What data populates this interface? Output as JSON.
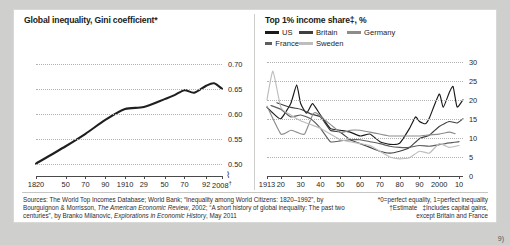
{
  "figure": {
    "page_marker": "9)",
    "background_color": "#cfcfcd",
    "paper_color": "#ffffff"
  },
  "left_panel": {
    "title": "Global inequality, Gini coefficient*"
  },
  "right_panel": {
    "title": "Top 1% income share‡, %",
    "legend": [
      {
        "label": "US",
        "color": "#1a1a1a"
      },
      {
        "label": "Britain",
        "color": "#3f3f3f"
      },
      {
        "label": "Germany",
        "color": "#8c8c8c"
      },
      {
        "label": "France",
        "color": "#5e5e5e"
      },
      {
        "label": "Sweden",
        "color": "#bdbdbd"
      }
    ]
  },
  "footnotes": {
    "sources": "Sources: The World Top Incomes Database; World Bank; “Inequality among World Citizens: 1820–1992”, by Bourguignon & Morrisson, The American Economic Review, 2002; “A short history of global inequality: The past two centuries”, by Branko Milanovic, Explorations in Economic History, May 2011",
    "sources_italic_1": "The American Economic Review",
    "sources_italic_2": "Explorations in Economic History",
    "note_star": "*0=perfect equality, 1=perfect inequality",
    "note_dagger": "†Estimate",
    "note_doubledagger": "‡Includes capital gains,",
    "note_doubledagger_2": "except Britain and France"
  },
  "chart_data": [
    {
      "type": "line",
      "id": "global-gini",
      "title": "Global inequality, Gini coefficient*",
      "xlabel": "",
      "ylabel": "",
      "ylim": [
        0.475,
        0.725
      ],
      "yticks": [
        0.5,
        0.55,
        0.6,
        0.65,
        0.7
      ],
      "ytick_labels": [
        "0.50",
        "0.55",
        "0.60",
        "0.65",
        "0.70"
      ],
      "xlim": [
        1820,
        2008
      ],
      "xtick_labels": [
        "1820",
        "50",
        "70",
        "90",
        "1910",
        "29",
        "50",
        "70",
        "92",
        "2008†"
      ],
      "xtick_values": [
        1820,
        1850,
        1870,
        1890,
        1910,
        1929,
        1950,
        1970,
        1992,
        2008
      ],
      "grid": true,
      "legend": "none",
      "axis_break": true,
      "series": [
        {
          "name": "Global Gini coefficient",
          "color": "#1f1f1f",
          "x": [
            1820,
            1850,
            1870,
            1890,
            1910,
            1929,
            1950,
            1960,
            1970,
            1980,
            1992,
            2000,
            2008
          ],
          "values": [
            0.5,
            0.535,
            0.56,
            0.588,
            0.61,
            0.614,
            0.63,
            0.638,
            0.648,
            0.643,
            0.657,
            0.662,
            0.651
          ]
        }
      ]
    },
    {
      "type": "line",
      "id": "top-1pc-income-share",
      "title": "Top 1% income share‡, %",
      "xlabel": "",
      "ylabel": "%",
      "ylim": [
        0,
        32
      ],
      "yticks": [
        0,
        5,
        10,
        15,
        20,
        25,
        30
      ],
      "ytick_labels": [
        "0",
        "5",
        "10",
        "15",
        "20",
        "25",
        "30"
      ],
      "xlim": [
        1913,
        2012
      ],
      "xtick_labels": [
        "1913",
        "20",
        "30",
        "40",
        "50",
        "60",
        "70",
        "80",
        "90",
        "2000",
        "10"
      ],
      "xtick_values": [
        1913,
        1920,
        1930,
        1940,
        1950,
        1960,
        1970,
        1980,
        1990,
        2000,
        2010
      ],
      "grid": true,
      "legend": "top",
      "series": [
        {
          "name": "US",
          "color": "#1a1a1a",
          "x": [
            1913,
            1916,
            1920,
            1925,
            1928,
            1930,
            1933,
            1936,
            1940,
            1945,
            1950,
            1955,
            1960,
            1965,
            1970,
            1975,
            1980,
            1985,
            1988,
            1990,
            1993,
            1995,
            2000,
            2002,
            2005,
            2007,
            2009,
            2012
          ],
          "values": [
            18.0,
            16.5,
            15.0,
            19.0,
            23.9,
            19.0,
            16.5,
            19.0,
            16.0,
            12.5,
            12.0,
            11.5,
            10.5,
            11.0,
            9.0,
            8.3,
            8.6,
            12.5,
            15.5,
            14.3,
            13.7,
            15.2,
            21.5,
            18.0,
            21.8,
            23.5,
            18.1,
            20.0
          ]
        },
        {
          "name": "Britain",
          "color": "#3f3f3f",
          "x": [
            1918,
            1925,
            1930,
            1935,
            1940,
            1945,
            1950,
            1955,
            1960,
            1965,
            1970,
            1975,
            1980,
            1985,
            1990,
            1995,
            2000,
            2005,
            2009,
            2012
          ],
          "values": [
            19.2,
            18.0,
            17.5,
            16.3,
            15.5,
            12.0,
            11.5,
            9.5,
            8.5,
            7.5,
            6.5,
            6.0,
            6.5,
            7.5,
            9.8,
            10.7,
            13.0,
            14.3,
            13.9,
            15.0
          ]
        },
        {
          "name": "Germany",
          "color": "#8c8c8c",
          "x": [
            1913,
            1920,
            1925,
            1928,
            1932,
            1936,
            1938,
            1950,
            1955,
            1960,
            1965,
            1970,
            1975,
            1980,
            1985,
            1990,
            1995,
            2000,
            2005,
            2008
          ],
          "values": [
            18.3,
            11.0,
            12.0,
            11.5,
            11.0,
            16.0,
            16.5,
            11.5,
            12.0,
            12.0,
            11.5,
            11.0,
            10.5,
            10.5,
            10.5,
            10.5,
            10.8,
            11.0,
            11.5,
            11.1
          ]
        },
        {
          "name": "France",
          "color": "#5e5e5e",
          "x": [
            1915,
            1920,
            1925,
            1930,
            1935,
            1940,
            1945,
            1950,
            1955,
            1960,
            1965,
            1970,
            1975,
            1980,
            1985,
            1990,
            1995,
            2000,
            2005,
            2010
          ],
          "values": [
            18.5,
            17.5,
            15.5,
            16.0,
            15.0,
            12.5,
            9.0,
            9.2,
            9.5,
            9.5,
            9.0,
            8.5,
            7.8,
            7.5,
            7.5,
            8.0,
            7.8,
            8.2,
            8.7,
            9.0
          ]
        },
        {
          "name": "Sweden",
          "color": "#bdbdbd",
          "x": [
            1913,
            1916,
            1920,
            1925,
            1930,
            1935,
            1940,
            1945,
            1950,
            1955,
            1960,
            1965,
            1970,
            1975,
            1980,
            1985,
            1990,
            1995,
            2000,
            2005,
            2010
          ],
          "values": [
            20.0,
            27.5,
            18.0,
            16.0,
            14.5,
            13.5,
            12.5,
            11.0,
            9.5,
            9.0,
            8.5,
            8.0,
            6.5,
            5.0,
            4.5,
            4.8,
            6.5,
            6.0,
            8.5,
            7.5,
            8.0
          ]
        }
      ]
    }
  ]
}
